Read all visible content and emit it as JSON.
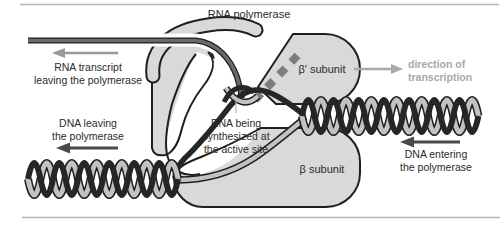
{
  "figure": {
    "title_label": "RNA polymerase",
    "type": "transcription-diagram"
  },
  "labels": {
    "rna_polymerase": "RNA polymerase",
    "rna_transcript_line1": "RNA transcript",
    "rna_transcript_line2": "leaving the polymerase",
    "beta_prime_subunit": "β′ subunit",
    "direction_line1": "direction of",
    "direction_line2": "transcription",
    "dna_leaving_line1": "DNA leaving",
    "dna_leaving_line2": "the polymerase",
    "active_site_line1": "RNA being",
    "active_site_line2": "synthesized at",
    "active_site_line3": "the active site",
    "beta_subunit": "β subunit",
    "dna_entering_line1": "DNA entering",
    "dna_entering_line2": "the polymerase"
  },
  "colors": {
    "polymerase_fill": "#d9d9d9",
    "outline": "#1f1f1f",
    "dna_template_strand": "#262626",
    "dna_nontemplate_strand": "#c2c2c2",
    "rna_strand": "#6a6a6a",
    "rna_dashed_channel": "#7d7d7d",
    "label_text": "#2b2b2b",
    "gray_text": "#a8a8a8",
    "gray_arrow": "#999999",
    "dark_arrow": "#4a4a4a",
    "border_line": "#b5b5b5",
    "background": "#ffffff"
  }
}
